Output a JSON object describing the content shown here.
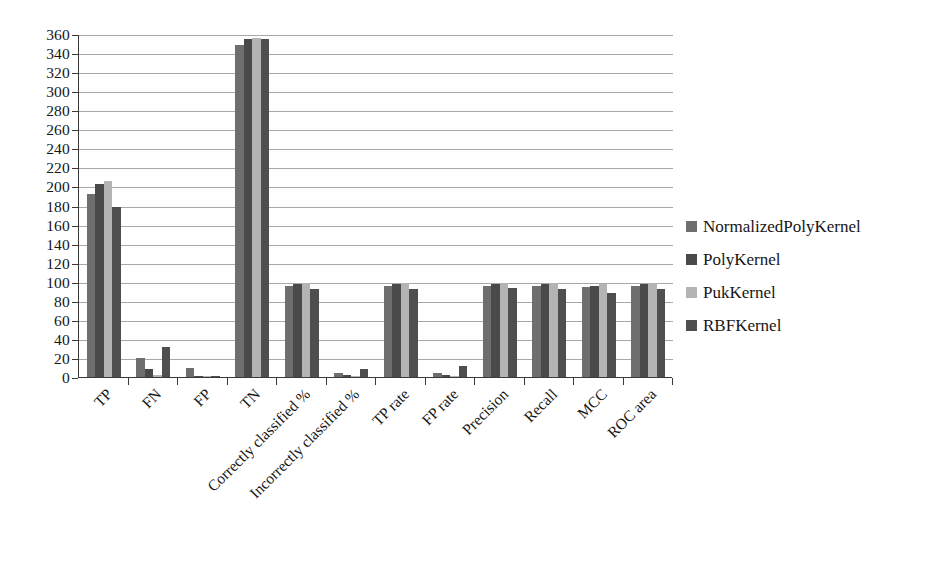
{
  "chart_data": {
    "type": "bar",
    "title": "",
    "xlabel": "",
    "ylabel": "",
    "ylim": [
      0,
      360
    ],
    "ytick_step": 20,
    "grid": true,
    "legend_position": "right",
    "orientation": "vertical",
    "grouped": true,
    "categories": [
      "TP",
      "FN",
      "FP",
      "TN",
      "Correctly classified %",
      "Incorrectly classified %",
      "TP rate",
      "FP rate",
      "Precision",
      "Recall",
      "MCC",
      "ROC area"
    ],
    "ytick_labels": [
      "0",
      "20",
      "40",
      "60",
      "80",
      "100",
      "120",
      "140",
      "160",
      "180",
      "200",
      "220",
      "240",
      "260",
      "280",
      "300",
      "320",
      "340",
      "360"
    ],
    "series": [
      {
        "name": "NormalizedPolyKernel",
        "color": "#6e6e6e",
        "values": [
          192,
          20,
          9,
          348,
          96,
          4,
          96,
          4,
          96,
          96,
          94,
          96
        ]
      },
      {
        "name": "PolyKernel",
        "color": "#4a4a4a",
        "values": [
          203,
          8,
          1,
          355,
          98,
          2,
          98,
          2,
          98,
          98,
          96,
          98
        ]
      },
      {
        "name": "PukKernel",
        "color": "#b4b4b4",
        "values": [
          206,
          2,
          1,
          356,
          99,
          1,
          99,
          1,
          99,
          99,
          98,
          99
        ]
      },
      {
        "name": "RBFKernel",
        "color": "#4f4f4f",
        "values": [
          178,
          31,
          1,
          355,
          92,
          8,
          92,
          12,
          93,
          92,
          88,
          92
        ]
      }
    ]
  },
  "legend": {
    "items": [
      {
        "label": "NormalizedPolyKernel",
        "color": "#6e6e6e"
      },
      {
        "label": "PolyKernel",
        "color": "#4a4a4a"
      },
      {
        "label": "PukKernel",
        "color": "#b4b4b4"
      },
      {
        "label": "RBFKernel",
        "color": "#4f4f4f"
      }
    ]
  },
  "axis": {
    "y_min": 0,
    "y_max": 360,
    "y_step": 20
  }
}
